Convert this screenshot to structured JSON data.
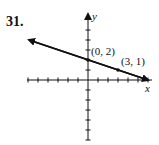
{
  "problem": {
    "number": "31."
  },
  "chart_data": {
    "type": "line",
    "title": "",
    "xlabel": "x",
    "ylabel": "y",
    "xlim": [
      -6,
      6
    ],
    "ylim": [
      -6,
      6
    ],
    "grid": false,
    "tick_step": 1,
    "series": [
      {
        "name": "line",
        "x": [
          -6,
          6
        ],
        "y": [
          4,
          0
        ],
        "arrows": "both"
      }
    ],
    "points": [
      {
        "x": 0,
        "y": 2,
        "label": "(0, 2)"
      },
      {
        "x": 3,
        "y": 1,
        "label": "(3, 1)"
      }
    ],
    "equation": "y = -1/3 x + 2"
  }
}
